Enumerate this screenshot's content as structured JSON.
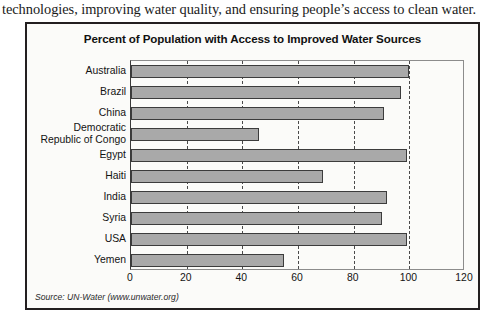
{
  "page": {
    "intro_text": "technologies, improving water quality, and ensuring people’s access to clean water."
  },
  "figure": {
    "title": "Percent of Population with Access to Improved Water Sources",
    "source_note": "Source: UN-Water (www.unwater.org)",
    "colors": {
      "bar_fill": "#a9a9a9",
      "bar_border": "#3c3c3c",
      "frame": "#231f20",
      "background": "#fbfbf9",
      "gridline": "#4a4a4a"
    }
  },
  "chart_data": {
    "type": "bar",
    "orientation": "horizontal",
    "title": "Percent of Population with Access to Improved Water Sources",
    "xlabel": "",
    "ylabel": "",
    "xlim": [
      0,
      120
    ],
    "xticks": [
      0,
      20,
      40,
      60,
      80,
      100,
      120
    ],
    "grid": true,
    "legend": false,
    "categories": [
      "Australia",
      "Brazil",
      "China",
      "Democratic\nRepublic of Congo",
      "Egypt",
      "Haiti",
      "India",
      "Syria",
      "USA",
      "Yemen"
    ],
    "values": [
      100,
      97,
      91,
      46,
      99,
      69,
      92,
      90,
      99,
      55
    ],
    "source": "UN-Water (www.unwater.org)"
  }
}
